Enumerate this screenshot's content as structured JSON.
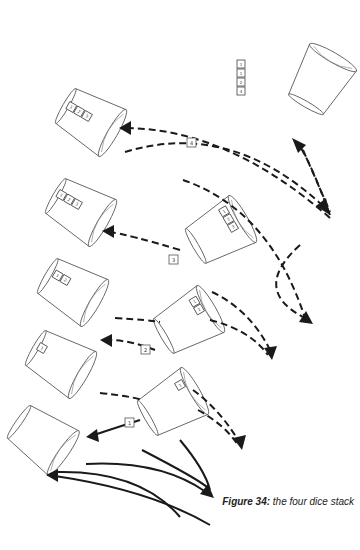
{
  "figure": {
    "caption_label": "Figure 34:",
    "caption_text": "the four dice stack"
  },
  "stack": {
    "dice": [
      "1",
      "1",
      "2",
      "4"
    ]
  },
  "step_labels": [
    "4",
    "3",
    "2",
    "1"
  ],
  "cups": [
    {
      "id": "top-right-cup",
      "dice": []
    },
    {
      "id": "row1-left-cup",
      "dice": [
        "1",
        "2",
        "3"
      ]
    },
    {
      "id": "row2-left-cup",
      "dice": [
        "1",
        "2",
        "3"
      ]
    },
    {
      "id": "row2-right-cup",
      "dice": [
        "1",
        "2",
        "3"
      ]
    },
    {
      "id": "row3-left-cup",
      "dice": [
        "1",
        "2"
      ]
    },
    {
      "id": "row3-right-cup",
      "dice": [
        "1",
        "2"
      ]
    },
    {
      "id": "row4-left-cup",
      "dice": [
        "1"
      ]
    },
    {
      "id": "row4-right-cup",
      "dice": [
        "1"
      ]
    },
    {
      "id": "bottom-left-cup",
      "dice": []
    }
  ],
  "colors": {
    "stroke": "#1a1a1a",
    "outline": "#555555",
    "background": "#ffffff"
  }
}
